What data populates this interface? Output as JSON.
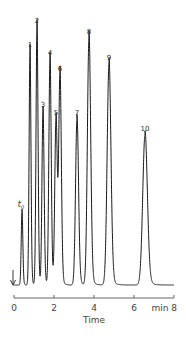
{
  "chart_data": {
    "type": "line",
    "title": "",
    "xlabel": "Time",
    "x_unit": "min",
    "ylabel": "",
    "xlim": [
      0,
      8
    ],
    "x_ticks": [
      0,
      2,
      4,
      6,
      8
    ],
    "x_tick_labels": [
      "0",
      "2",
      "4",
      "6",
      "min  8"
    ],
    "grid": false,
    "legend": null,
    "injection_marker": {
      "time": 0,
      "symbol": "arrow-down"
    },
    "peaks": [
      {
        "label": "t0",
        "time": 0.4,
        "relative_height": 0.28
      },
      {
        "label": "1",
        "time": 0.8,
        "relative_height": 0.89
      },
      {
        "label": "2",
        "time": 1.15,
        "relative_height": 0.98
      },
      {
        "label": "3",
        "time": 1.45,
        "relative_height": 0.66
      },
      {
        "label": "4",
        "time": 1.8,
        "relative_height": 0.86
      },
      {
        "label": "5",
        "time": 2.1,
        "relative_height": 0.63
      },
      {
        "label": "6",
        "time": 2.3,
        "relative_height": 0.8
      },
      {
        "label": "7",
        "time": 3.15,
        "relative_height": 0.63
      },
      {
        "label": "8",
        "time": 3.75,
        "relative_height": 0.94
      },
      {
        "label": "9",
        "time": 4.75,
        "relative_height": 0.84
      },
      {
        "label": "10",
        "time": 6.55,
        "relative_height": 0.57
      }
    ]
  },
  "labels": {
    "t0": "t",
    "t0_sub": "0",
    "xlabel": "Time",
    "tick_0": "0",
    "tick_2": "2",
    "tick_4": "4",
    "tick_6": "6",
    "tick_8": "min  8"
  }
}
